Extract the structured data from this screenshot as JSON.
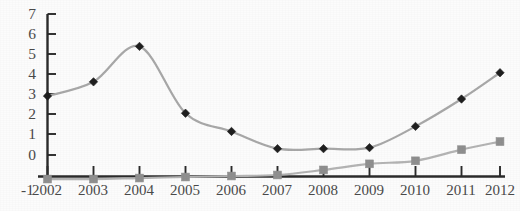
{
  "chart_data": {
    "type": "line",
    "title": "",
    "subtitle": "",
    "xlabel": "",
    "ylabel": "",
    "categories": [
      "2002",
      "2003",
      "2004",
      "2005",
      "2006",
      "2007",
      "2008",
      "2009",
      "2010",
      "2011",
      "2012"
    ],
    "x": [
      2002,
      2003,
      2004,
      2005,
      2006,
      2007,
      2008,
      2009,
      2010,
      2011,
      2012
    ],
    "series": [
      {
        "name": "series-1",
        "marker": "diamond",
        "marker_color": "#1f1f1f",
        "line_color": "#a8a8a8",
        "smoothed": true,
        "values": [
          3.95,
          4.65,
          6.4,
          3.1,
          2.2,
          1.35,
          1.35,
          1.4,
          2.45,
          3.8,
          5.1
        ]
      },
      {
        "name": "series-2",
        "marker": "square",
        "marker_color": "#8f8f8f",
        "line_color": "#b4b4b4",
        "smoothed": true,
        "values": [
          -0.15,
          -0.15,
          -0.1,
          -0.05,
          0.0,
          0.05,
          0.3,
          0.6,
          0.75,
          1.3,
          1.7
        ]
      }
    ],
    "ylim": [
      -1,
      7
    ],
    "ytick_labels": [
      "7",
      "6",
      "5",
      "4",
      "3",
      "2",
      "1",
      "0",
      "-1"
    ],
    "ytick_values": [
      7,
      6,
      5,
      4,
      3,
      2,
      1,
      0,
      -1
    ],
    "xtick_labels": [
      "2002",
      "2003",
      "2004",
      "2005",
      "2006",
      "2007",
      "2008",
      "2009",
      "2010",
      "2011",
      "2012"
    ],
    "grid": false,
    "legend": "none",
    "axis_color": "#2b2b2b",
    "background_color": "#fcfcfc"
  }
}
